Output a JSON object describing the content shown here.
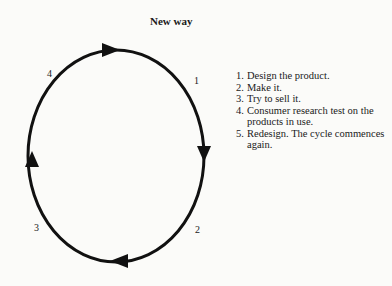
{
  "title": "New way",
  "cycle": {
    "labels": [
      "1",
      "2",
      "3",
      "4"
    ],
    "direction": "clockwise"
  },
  "steps": [
    {
      "num": "1.",
      "text": "Design the product."
    },
    {
      "num": "2.",
      "text": "Make it."
    },
    {
      "num": "3.",
      "text": "Try to sell it."
    },
    {
      "num": "4.",
      "text": "Consumer research test on the products in use."
    },
    {
      "num": "5.",
      "text": "Redesign. The cycle commences again."
    }
  ]
}
